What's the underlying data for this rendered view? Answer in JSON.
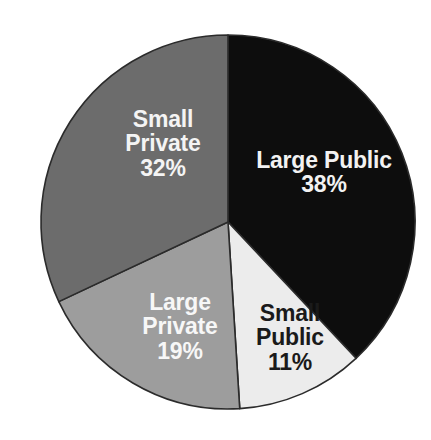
{
  "chart_data": {
    "type": "pie",
    "title": "",
    "subtitle": "",
    "xlabel": "",
    "ylabel": "",
    "legend_position": "none",
    "grid": false,
    "labels_inside_slices": true,
    "start_angle_deg": 0,
    "direction": "clockwise",
    "categories": [
      "Large Public",
      "Small Public",
      "Large Private",
      "Small Private"
    ],
    "values": [
      38,
      11,
      19,
      32
    ],
    "unit": "%",
    "slices": [
      {
        "name": "large-public",
        "label": "Large Public",
        "value": 38,
        "value_text": "38%",
        "color": "#0d0d0d",
        "text_color": "#f2f2f2"
      },
      {
        "name": "small-public",
        "label": "Small Public",
        "value": 11,
        "value_text": "11%",
        "color": "#ececec",
        "text_color": "#1a1a1a"
      },
      {
        "name": "large-private",
        "label": "Large Private",
        "value": 19,
        "value_text": "19%",
        "color": "#9d9d9d",
        "text_color": "#f7f7f7"
      },
      {
        "name": "small-private",
        "label": "Small Private",
        "value": 32,
        "value_text": "32%",
        "color": "#6c6c6c",
        "text_color": "#f4f4f4"
      }
    ]
  },
  "labels": {
    "large_public": {
      "line1": "Large Public",
      "line2": "38%"
    },
    "small_public": {
      "line1": "Small",
      "line2": "Public",
      "line3": "11%"
    },
    "large_private": {
      "line1": "Large",
      "line2": "Private",
      "line3": "19%"
    },
    "small_private": {
      "line1": "Small",
      "line2": "Private",
      "line3": "32%"
    }
  },
  "geometry": {
    "center_x": 228,
    "center_y": 222,
    "radius": 187,
    "stroke_color": "#2b2b2b"
  },
  "background": {
    "color": "#ffffff"
  }
}
